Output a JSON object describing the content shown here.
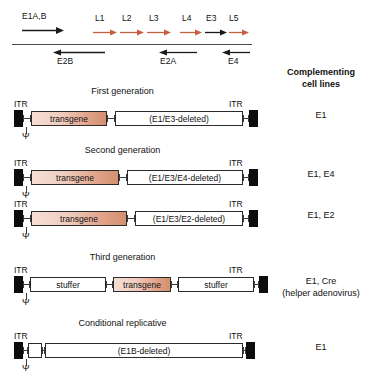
{
  "figure": {
    "genome_map": {
      "forward_genes": [
        {
          "name": "E1A,B",
          "color": "#1a1a1a",
          "x": 22,
          "width": 42,
          "label_x": 22
        },
        {
          "name": "L1",
          "color": "#c4603f",
          "x": 93,
          "width": 24,
          "label_x": 95
        },
        {
          "name": "L2",
          "color": "#c4603f",
          "x": 120,
          "width": 24,
          "label_x": 122
        },
        {
          "name": "L3",
          "color": "#c4603f",
          "x": 147,
          "width": 24,
          "label_x": 149
        },
        {
          "name": "L4",
          "color": "#c4603f",
          "x": 180,
          "width": 22,
          "label_x": 182
        },
        {
          "name": "E3",
          "color": "#1a1a1a",
          "x": 205,
          "width": 22,
          "label_x": 206
        },
        {
          "name": "L5",
          "color": "#c4603f",
          "x": 229,
          "width": 20,
          "label_x": 229
        }
      ],
      "reverse_genes": [
        {
          "name": "E2B",
          "color": "#1a1a1a",
          "x": 53,
          "width": 52,
          "label_x": 57
        },
        {
          "name": "E2A",
          "color": "#1a1a1a",
          "x": 159,
          "width": 38,
          "label_x": 160
        },
        {
          "name": "E4",
          "color": "#1a1a1a",
          "x": 222,
          "width": 28,
          "label_x": 228
        }
      ]
    },
    "right_column": {
      "heading_line1": "Complementing",
      "heading_line2": "cell lines",
      "items": [
        {
          "text": "E1"
        },
        {
          "text": "E1, E4"
        },
        {
          "text": "E1, E2"
        },
        {
          "text": "E1, Cre",
          "sub": "(helper adenovirus)"
        },
        {
          "text": "E1"
        }
      ]
    },
    "constructs": [
      {
        "title": "First generation",
        "itr_left_label": "ITR",
        "itr_right_label": "ITR",
        "psi": "Ψ",
        "segments": [
          {
            "label": "transgene",
            "kind": "transgene",
            "width": 76
          },
          {
            "label": "(E1/E3-deleted)",
            "kind": "plain",
            "width": 128
          }
        ]
      },
      {
        "title": "Second generation",
        "itr_left_label": "ITR",
        "itr_right_label": "ITR",
        "psi": "Ψ",
        "segments": [
          {
            "label": "transgene",
            "kind": "transgene",
            "width": 88
          },
          {
            "label": "(E1/E3/E4-deleted)",
            "kind": "plain",
            "width": 116
          }
        ]
      },
      {
        "title": "",
        "itr_left_label": "ITR",
        "itr_right_label": "ITR",
        "psi": "Ψ",
        "segments": [
          {
            "label": "transgene",
            "kind": "transgene",
            "width": 96
          },
          {
            "label": "(E1/E3/E2-deleted)",
            "kind": "plain",
            "width": 108
          }
        ]
      },
      {
        "title": "Third generation",
        "itr_left_label": "ITR",
        "itr_right_label": "ITR",
        "psi": "Ψ",
        "segments": [
          {
            "label": "stuffer",
            "kind": "plain",
            "width": 76
          },
          {
            "label": "transgene",
            "kind": "transgene",
            "width": 58
          },
          {
            "label": "stuffer",
            "kind": "plain",
            "width": 76
          }
        ]
      },
      {
        "title": "Conditional replicative",
        "itr_left_label": "ITR",
        "itr_right_label": "ITR",
        "psi": "Ψ",
        "segments": [
          {
            "label": "",
            "kind": "plain",
            "width": 14
          },
          {
            "label": "(E1B-deleted)",
            "kind": "plain",
            "width": 198
          }
        ]
      }
    ]
  }
}
